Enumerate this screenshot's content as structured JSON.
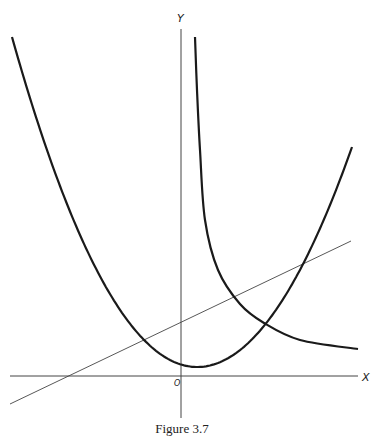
{
  "figure": {
    "caption": "Figure 3.7",
    "x_axis_label": "X",
    "y_axis_label": "Y",
    "origin_label": "O"
  },
  "colors": {
    "axis": "#444444",
    "curve": "#1a1a1a",
    "line": "#444444",
    "background": "#ffffff"
  },
  "geometry": {
    "origin_px": [
      181,
      376
    ],
    "x_axis_px": [
      [
        10,
        376
      ],
      [
        358,
        376
      ]
    ],
    "y_axis_px": [
      [
        181,
        29
      ],
      [
        181,
        418
      ]
    ],
    "straight_line_px": [
      [
        10,
        404
      ],
      [
        351,
        241
      ]
    ],
    "parabola": {
      "vertex_px": [
        197,
        367
      ],
      "left_end_px": [
        12,
        37
      ],
      "right_end_px": [
        352,
        147
      ]
    },
    "hyperbola_points_px": [
      [
        195,
        37
      ],
      [
        197,
        90
      ],
      [
        200,
        150
      ],
      [
        205,
        220
      ],
      [
        218,
        270
      ],
      [
        240,
        304
      ],
      [
        264,
        323
      ],
      [
        300,
        340
      ],
      [
        358,
        349
      ]
    ]
  },
  "chart_data": {
    "type": "line",
    "title": "Figure 3.7",
    "xlabel": "X",
    "ylabel": "Y",
    "grid": false,
    "series": [
      {
        "name": "parabola (U-shaped curve)",
        "shape": "convex, minimum slightly right of Y axis, just above X axis"
      },
      {
        "name": "hyperbola-like decreasing curve",
        "shape": "asymptotic to Y axis on the left, decreasing toward a horizontal asymptote above X axis"
      },
      {
        "name": "straight line",
        "shape": "positive slope, crossing X axis left of origin and Y axis above origin"
      }
    ]
  }
}
